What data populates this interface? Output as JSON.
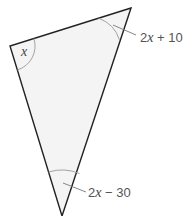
{
  "diagram": {
    "type": "triangle",
    "fill_color": "#f4f4f4",
    "stroke_color": "#222222",
    "arc_color": "#999999",
    "vertices": {
      "top_right": {
        "x": 131,
        "y": 8
      },
      "left": {
        "x": 10,
        "y": 46
      },
      "bottom": {
        "x": 62,
        "y": 216
      }
    },
    "angles": [
      {
        "vertex": "left",
        "label_var": "x",
        "label_rest": ""
      },
      {
        "vertex": "top_right",
        "label_var": "2x",
        "label_rest": " + 10"
      },
      {
        "vertex": "bottom",
        "label_var": "2x",
        "label_rest": " − 30"
      }
    ],
    "labels": {
      "left_angle": "x",
      "top_right_angle_coef": "2",
      "top_right_angle_var": "x",
      "top_right_angle_rest": " + 10",
      "bottom_angle_coef": "2",
      "bottom_angle_var": "x",
      "bottom_angle_rest": " − 30"
    }
  }
}
